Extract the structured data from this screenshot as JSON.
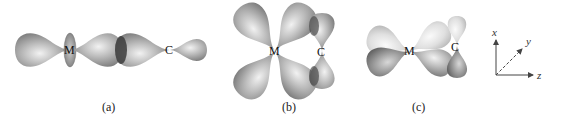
{
  "figure": {
    "panels": [
      {
        "id": "a",
        "caption": "(a)",
        "description": "sigma bond: metal d orbital overlapping carbon lone-pair lobe along z axis",
        "atoms": {
          "metal": "M",
          "carbon": "C"
        }
      },
      {
        "id": "b",
        "caption": "(b)",
        "description": "pi back-bond: metal d orbital overlapping carbon p orbital",
        "atoms": {
          "metal": "M",
          "carbon": "C"
        }
      },
      {
        "id": "c",
        "caption": "(c)",
        "description": "pi back-bond with shaded phases of metal d and carbon p orbitals",
        "atoms": {
          "metal": "M",
          "carbon": "C"
        }
      }
    ],
    "axes": {
      "x": "x",
      "y": "y",
      "z": "z"
    },
    "colors": {
      "lobe_mid": "#9a9a9a",
      "lobe_light": "#e6e6e6",
      "lobe_dark": "#5a5a5a",
      "lobe_pale": "#d8d8d8",
      "overlap": "#3c3c3c",
      "axis": "#444444"
    }
  }
}
